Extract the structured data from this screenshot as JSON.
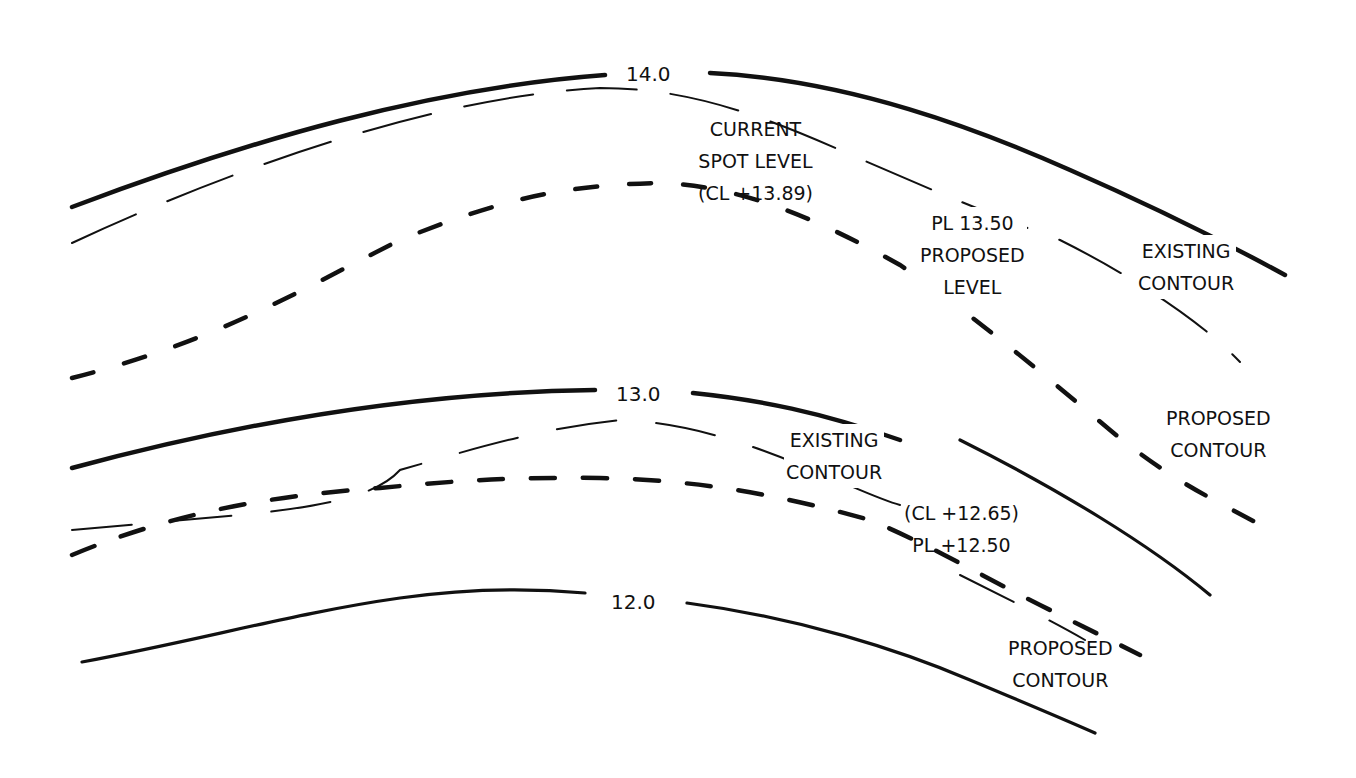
{
  "diagram": {
    "type": "contour-grading-plan",
    "line_styles": {
      "contour_line": "thick solid",
      "existing_contour": "thin long dash",
      "proposed_contour": "thick short dash"
    },
    "contour_levels": [
      {
        "id": "c14",
        "label": "14.0"
      },
      {
        "id": "c13",
        "label": "13.0"
      },
      {
        "id": "c12",
        "label": "12.0"
      }
    ],
    "annotations": {
      "current_spot_level": [
        "CURRENT",
        "SPOT LEVEL",
        "(CL +13.89)"
      ],
      "proposed_level_upper": [
        "PL 13.50",
        "PROPOSED",
        "LEVEL"
      ],
      "existing_contour_upper": [
        "EXISTING",
        "CONTOUR"
      ],
      "proposed_contour_upper": [
        "PROPOSED",
        "CONTOUR"
      ],
      "existing_contour_lower": [
        "EXISTING",
        "CONTOUR"
      ],
      "spot_levels_lower": [
        "(CL +12.65)",
        "PL +12.50"
      ],
      "proposed_contour_lower": [
        "PROPOSED",
        "CONTOUR"
      ]
    },
    "colors": {
      "ink": "#111111",
      "background": "#ffffff"
    }
  }
}
